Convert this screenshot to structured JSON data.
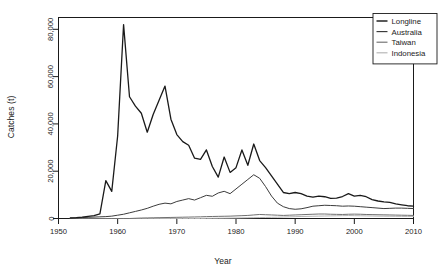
{
  "chart_data": {
    "type": "line",
    "title": "",
    "xlabel": "Year",
    "ylabel": "Catches (t)",
    "xlim": [
      1950,
      2010
    ],
    "ylim": [
      0,
      85000
    ],
    "xticks": [
      1950,
      1960,
      1970,
      1980,
      1990,
      2000,
      2010
    ],
    "xtick_labels": [
      "1950",
      "1960",
      "1970",
      "1980",
      "1990",
      "2000",
      "2010"
    ],
    "yticks": [
      0,
      20000,
      40000,
      60000,
      80000
    ],
    "ytick_labels": [
      "0",
      "20,000",
      "40,000",
      "60,000",
      "80,000"
    ],
    "grid": false,
    "legend_position": "top-right",
    "x": [
      1952,
      1953,
      1954,
      1955,
      1956,
      1957,
      1958,
      1959,
      1960,
      1961,
      1962,
      1963,
      1964,
      1965,
      1966,
      1967,
      1968,
      1969,
      1970,
      1971,
      1972,
      1973,
      1974,
      1975,
      1976,
      1977,
      1978,
      1979,
      1980,
      1981,
      1982,
      1983,
      1984,
      1985,
      1986,
      1987,
      1988,
      1989,
      1990,
      1991,
      1992,
      1993,
      1994,
      1995,
      1996,
      1997,
      1998,
      1999,
      2000,
      2001,
      2002,
      2003,
      2004,
      2005,
      2006,
      2007,
      2008,
      2009,
      2010
    ],
    "series": [
      {
        "name": "Longline",
        "color": "#1a1a1a",
        "width": 1.3,
        "values": [
          300,
          400,
          600,
          900,
          1200,
          2000,
          16000,
          11500,
          35000,
          82000,
          51500,
          47500,
          44500,
          36500,
          44000,
          50000,
          56000,
          42000,
          35500,
          32500,
          31000,
          25500,
          25000,
          29000,
          22000,
          17500,
          26000,
          19500,
          21500,
          29000,
          22500,
          31500,
          24500,
          21500,
          18000,
          14500,
          11000,
          10500,
          11000,
          10500,
          9500,
          9000,
          9500,
          9200,
          8500,
          8600,
          9300,
          10500,
          9500,
          9800,
          9200,
          8000,
          7400,
          7000,
          6800,
          6200,
          5800,
          5400,
          5200
        ]
      },
      {
        "name": "Australia",
        "color": "#3c3c3c",
        "width": 1.0,
        "values": [
          150,
          250,
          400,
          500,
          600,
          700,
          800,
          1000,
          1400,
          1800,
          2400,
          3000,
          3600,
          4300,
          5200,
          6000,
          6500,
          6200,
          7200,
          7800,
          8400,
          7800,
          8800,
          9800,
          9400,
          10800,
          11500,
          10500,
          12500,
          14500,
          16500,
          18500,
          17000,
          13500,
          9500,
          6500,
          5000,
          4200,
          3900,
          4100,
          4600,
          5200,
          5400,
          5600,
          5500,
          5400,
          5200,
          5300,
          5200,
          5000,
          4800,
          4600,
          4400,
          4200,
          4300,
          4400,
          4400,
          4300,
          4200
        ]
      },
      {
        "name": "Taiwan",
        "color": "#707070",
        "width": 1.0,
        "values": [
          0,
          0,
          0,
          0,
          0,
          0,
          0,
          0,
          0,
          0,
          0,
          100,
          200,
          250,
          300,
          350,
          400,
          450,
          500,
          550,
          600,
          650,
          700,
          800,
          850,
          900,
          950,
          1000,
          1100,
          1200,
          1300,
          1500,
          1700,
          1600,
          1500,
          1400,
          1300,
          1400,
          1500,
          1600,
          1700,
          1800,
          1900,
          1900,
          1800,
          1750,
          1700,
          1800,
          1850,
          1800,
          1700,
          1650,
          1600,
          1550,
          1500,
          1450,
          1400,
          1350,
          1300
        ]
      },
      {
        "name": "Indonesia",
        "color": "#b4b4b4",
        "width": 1.0,
        "values": [
          0,
          0,
          0,
          0,
          0,
          0,
          0,
          0,
          0,
          0,
          0,
          0,
          0,
          0,
          0,
          0,
          0,
          0,
          0,
          0,
          0,
          0,
          0,
          50,
          80,
          100,
          130,
          160,
          200,
          250,
          300,
          350,
          400,
          450,
          500,
          550,
          620,
          700,
          780,
          850,
          900,
          950,
          1000,
          1050,
          1100,
          1150,
          1200,
          1250,
          1200,
          1150,
          1100,
          1050,
          1000,
          980,
          950,
          920,
          900,
          880,
          860
        ]
      }
    ]
  },
  "legend": {
    "items": [
      {
        "label": "Longline"
      },
      {
        "label": "Australia"
      },
      {
        "label": "Taiwan"
      },
      {
        "label": "Indonesia"
      }
    ]
  }
}
